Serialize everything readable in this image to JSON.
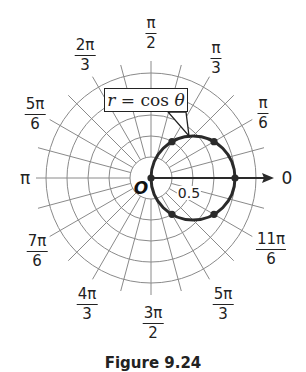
{
  "figure": {
    "curve_equation": {
      "lhs": "r",
      "eq": " = cos ",
      "theta": "θ"
    },
    "origin_label": "O",
    "radius_label": "0.5",
    "caption": "Figure 9.24",
    "angle_labels": {
      "zero": "0",
      "pi": "π",
      "pi_over_6": {
        "num": "π",
        "den": "6"
      },
      "pi_over_3": {
        "num": "π",
        "den": "3"
      },
      "pi_over_2": {
        "num": "π",
        "den": "2"
      },
      "two_pi_over_3": {
        "num": "2π",
        "den": "3"
      },
      "five_pi_over_6": {
        "num": "5π",
        "den": "6"
      },
      "seven_pi_over_6": {
        "num": "7π",
        "den": "6"
      },
      "four_pi_over_3": {
        "num": "4π",
        "den": "3"
      },
      "three_pi_over_2": {
        "num": "3π",
        "den": "2"
      },
      "five_pi_over_3": {
        "num": "5π",
        "den": "3"
      },
      "eleven_pi_over_6": {
        "num": "11π",
        "den": "6"
      }
    },
    "grid": {
      "circle_count": 5,
      "radius_step": 0.25,
      "radial_line_step_degrees": 15
    },
    "plotted_points": [
      {
        "theta": "0",
        "r": 1
      },
      {
        "theta": "π/6",
        "r": 0.866
      },
      {
        "theta": "π/3",
        "r": 0.5
      },
      {
        "theta": "π/2",
        "r": 0
      },
      {
        "theta": "2π/3",
        "r": -0.5
      },
      {
        "theta": "5π/6",
        "r": -0.866
      }
    ],
    "colors": {
      "grid": "#8a8a8a",
      "curve": "#2a2a2a",
      "text": "#222222"
    }
  }
}
